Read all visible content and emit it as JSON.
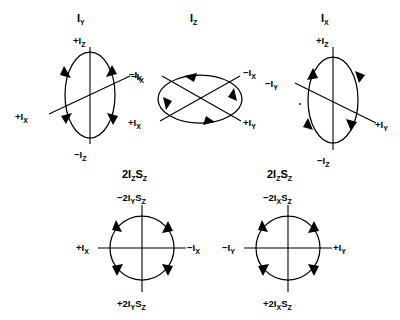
{
  "figure": {
    "background_color": "#ffffff",
    "ink_color": "#000000"
  },
  "diagrams": [
    {
      "id": "iy",
      "title": "I",
      "title_sub": "Y",
      "shape": "ellipse-vertical",
      "rotation": "counterclockwise",
      "labels": {
        "top": "+I",
        "top_sub": "Z",
        "bottom": "−I",
        "bottom_sub": "Z",
        "diag_upper_right": "−I",
        "diag_upper_right_sub": "X",
        "diag_lower_left": "+I",
        "diag_lower_left_sub": "X"
      }
    },
    {
      "id": "iz",
      "title": "I",
      "title_sub": "Z",
      "shape": "ellipse-horizontal",
      "rotation": "counterclockwise",
      "labels": {
        "diag_upper_left": "−I",
        "diag_upper_left_sub": "Y",
        "diag_lower_right": "+I",
        "diag_lower_right_sub": "Y",
        "diag_upper_right": "−I",
        "diag_upper_right_sub": "X",
        "diag_lower_left": "+I",
        "diag_lower_left_sub": "X"
      }
    },
    {
      "id": "ix",
      "title": "I",
      "title_sub": "X",
      "shape": "ellipse-vertical",
      "rotation": "clockwise",
      "labels": {
        "top": "+I",
        "top_sub": "Z",
        "bottom": "−I",
        "bottom_sub": "Z",
        "diag_upper_left": "−I",
        "diag_upper_left_sub": "Y",
        "diag_lower_right": "+I",
        "diag_lower_right_sub": "Y"
      }
    },
    {
      "id": "2izsz-left",
      "title_pre": "2I",
      "title_sub1": "Z",
      "title_mid": "S",
      "title_sub2": "Z",
      "shape": "circle",
      "rotation": "counterclockwise",
      "labels": {
        "top": "−2I",
        "top_sub1": "Y",
        "top_mid": "S",
        "top_sub2": "Z",
        "bottom": "+2I",
        "bottom_sub1": "Y",
        "bottom_mid": "S",
        "bottom_sub2": "Z",
        "left": "+I",
        "left_sub": "X",
        "right": "−I",
        "right_sub": "X"
      }
    },
    {
      "id": "2izsz-right",
      "title_pre": "2I",
      "title_sub1": "Z",
      "title_mid": "S",
      "title_sub2": "Z",
      "shape": "circle",
      "rotation": "counterclockwise",
      "labels": {
        "top": "−2I",
        "top_sub1": "X",
        "top_mid": "S",
        "top_sub2": "Z",
        "bottom": "+2I",
        "bottom_sub1": "X",
        "bottom_mid": "S",
        "bottom_sub2": "Z",
        "left": "−I",
        "left_sub": "Y",
        "right": "+I",
        "right_sub": "Y"
      }
    }
  ]
}
